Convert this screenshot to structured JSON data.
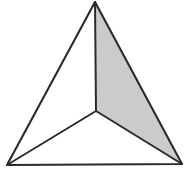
{
  "figure": {
    "name": "subdivided-triangle",
    "background_color": "#ffffff",
    "line_color": "#2b2b2b",
    "line_width": 2.1,
    "shaded_fill_color": "#cbcbcb",
    "plain_fill_color": "#ffffff",
    "vertices": {
      "apex": {
        "label": "apex",
        "x": 95,
        "y": 2
      },
      "bottom_left": {
        "label": "bottom-left",
        "x": 7,
        "y": 165
      },
      "bottom_right": {
        "label": "bottom-right",
        "x": 182,
        "y": 164
      },
      "center": {
        "label": "interior-point",
        "x": 96,
        "y": 111
      }
    },
    "outer_outline_points": "95,2 182,164 7,165",
    "regions": [
      {
        "name": "left-region",
        "shaded": false,
        "fill": "#ffffff",
        "points": "95,2 96,111 7,165"
      },
      {
        "name": "bottom-region",
        "shaded": false,
        "fill": "#ffffff",
        "points": "96,111 182,164 7,165"
      },
      {
        "name": "right-region",
        "shaded": true,
        "fill": "#cbcbcb",
        "points": "95,2 182,164 96,111"
      }
    ],
    "spokes": [
      {
        "name": "spoke-to-apex",
        "d": "M 96 111 L 95 2"
      },
      {
        "name": "spoke-to-bottom-left",
        "d": "M 96 111 L 7 165"
      },
      {
        "name": "spoke-to-bottom-right",
        "d": "M 96 111 L 182 164"
      }
    ]
  }
}
